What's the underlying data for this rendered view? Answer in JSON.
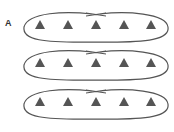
{
  "figure": {
    "panel_label": "A",
    "colors": {
      "loop_stroke": "#555555",
      "triangle_fill": "#555555",
      "background": "#ffffff"
    },
    "loops": [
      {
        "id": "loop-1",
        "cy": 27,
        "triangles": 5
      },
      {
        "id": "loop-2",
        "cy": 65,
        "triangles": 5
      },
      {
        "id": "loop-3",
        "cy": 104,
        "triangles": 5
      }
    ],
    "triangle_x": [
      40,
      68,
      96,
      124,
      151
    ],
    "shape": "triangle",
    "loop_shape": "twisted-ellipse"
  }
}
